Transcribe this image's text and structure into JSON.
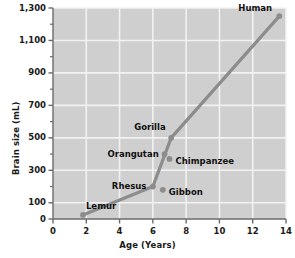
{
  "chart_data": {
    "type": "line",
    "title": "",
    "xlabel": "Age (Years)",
    "ylabel": "Brain size (mL)",
    "xlim": [
      0,
      14
    ],
    "ylim": [
      0,
      1300
    ],
    "grid": true,
    "legend": "none",
    "xticks": [
      "0",
      "2",
      "4",
      "6",
      "8",
      "10",
      "12",
      "14"
    ],
    "xtick_values": [
      0,
      2,
      4,
      6,
      8,
      10,
      12,
      14
    ],
    "yticks": [
      "0",
      "100",
      "300",
      "500",
      "700",
      "900",
      "1,100",
      "1,300"
    ],
    "ytick_values": [
      0,
      100,
      300,
      500,
      700,
      900,
      1100,
      1300
    ],
    "yminor_values": [
      200,
      400,
      600,
      800,
      1000,
      1200
    ],
    "series": [
      {
        "name": "Primate brain size vs age",
        "x": [
          1.8,
          6.0,
          7.1,
          13.6
        ],
        "y": [
          25,
          200,
          500,
          1250
        ],
        "connected": true
      }
    ],
    "points": [
      {
        "label": "Lemur",
        "x": 1.8,
        "y": 25,
        "label_pos": "right-above"
      },
      {
        "label": "Rhesus",
        "x": 6.0,
        "y": 200,
        "label_pos": "left"
      },
      {
        "label": "Gibbon",
        "x": 6.6,
        "y": 180,
        "label_pos": "right"
      },
      {
        "label": "Orangutan",
        "x": 6.7,
        "y": 400,
        "label_pos": "left"
      },
      {
        "label": "Chimpanzee",
        "x": 7.0,
        "y": 370,
        "label_pos": "right"
      },
      {
        "label": "Gorilla",
        "x": 7.1,
        "y": 500,
        "label_pos": "left-above"
      },
      {
        "label": "Human",
        "x": 13.6,
        "y": 1250,
        "label_pos": "left-above"
      }
    ],
    "colors": {
      "plot_background": "#cfcfcf",
      "gridline": "#f2f2f2",
      "line": "#8c8c8c",
      "marker": "#8c8c8c",
      "axis": "#6b6b6b",
      "text": "#111111"
    }
  }
}
